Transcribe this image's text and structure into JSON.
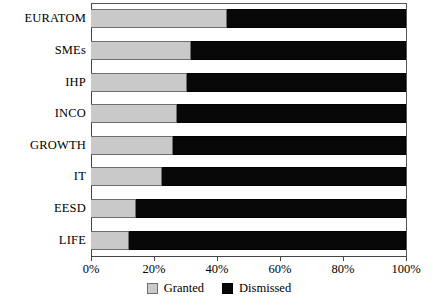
{
  "chart_data": {
    "type": "bar",
    "orientation": "horizontal",
    "stacked": true,
    "normalized": true,
    "title": "",
    "subtitle": "",
    "xlabel": "",
    "ylabel": "",
    "xlim": [
      0,
      100
    ],
    "xunit": "%",
    "grid": false,
    "legend_position": "bottom-center",
    "categories": [
      "EURATOM",
      "SMEs",
      "IHP",
      "INCO",
      "GROWTH",
      "IT",
      "EESD",
      "LIFE"
    ],
    "xticks": [
      0,
      20,
      40,
      60,
      80,
      100
    ],
    "xticklabels": [
      "0%",
      "20%",
      "40%",
      "60%",
      "80%",
      "100%"
    ],
    "series": [
      {
        "name": "Granted",
        "color": "#c9c9c9",
        "values": [
          43.3,
          31.8,
          30.6,
          27.4,
          26.1,
          22.6,
          14.3,
          12.1
        ]
      },
      {
        "name": "Dismissed",
        "color": "#080808",
        "values": [
          56.7,
          68.2,
          69.4,
          72.6,
          73.9,
          77.4,
          85.7,
          87.9
        ]
      }
    ]
  },
  "legend": {
    "items": [
      {
        "label": "Granted",
        "swatch": "granted"
      },
      {
        "label": "Dismissed",
        "swatch": "dismissed"
      }
    ]
  }
}
